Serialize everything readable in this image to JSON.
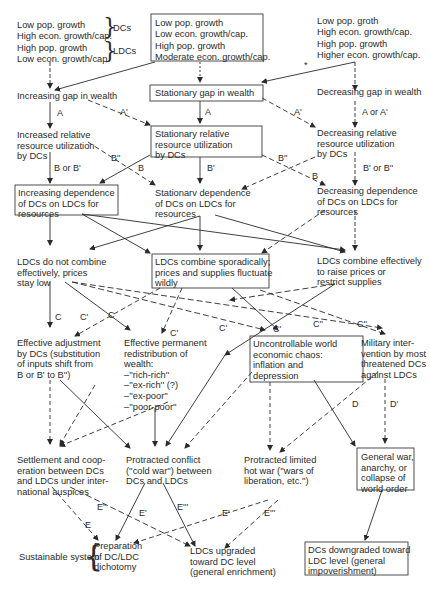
{
  "scenarios": {
    "left": {
      "dc_line1": "Low pop. growth",
      "dc_line2": "High econ. growth/cap.",
      "dc_tag": "DCs",
      "ldc_line1": "High pop. growth",
      "ldc_line2": "Low econ. growth/cap.",
      "ldc_tag": "LDCs"
    },
    "center": {
      "line1": "Low pop. growth",
      "line2": "Low econ. growth/cap.",
      "line3": "High pop. growth",
      "line4": "Moderate econ. growth/cap."
    },
    "right": {
      "line1": "Low pop. groth",
      "line2": "High econ. growth/cap.",
      "line3": "High pop. growth",
      "line4": "Higher econ. growth/cap."
    }
  },
  "nodes": {
    "gap_increasing": "Increasing gap in wealth",
    "gap_stationary": "Stationary gap in wealth",
    "gap_decreasing": "Decreasing gap in wealth",
    "util_increased": "Increased relative\nresource utilization\nby DCs",
    "util_stationary": "Stationary relative\nresource utilization\nby DCs",
    "util_decreasing": "Decreasing relative\nresource utilization\nby DCs",
    "dep_increasing": "Increasing dependence\nof DCs on LDCs for\nresources",
    "dep_stationary": "Stationarv dependence\nof DCs on LDCs for\nresources",
    "dep_decreasing": "Decreasing dependence\nof DCs on LDCs for\nresources",
    "ldc_not_combine": "LDCs do not combine\neffectively, prices\nstay low",
    "ldc_sporadic": "LDCs combine sporadically;\nprices and supplies fluctuate\nwildly",
    "ldc_effective": "LDCs combine effectively\nto raise prices or\nrestrict supplies",
    "adjustment": "Effective adjustment\nby DCs (substitution\nof inputs shift from\nB or B' to B'')",
    "redistribution": "Effective permanent\nredistribution of\nwealth:\n–''rich-rich''\n–''ex-rich'' (?)\n–''ex-poor''\n–''poor-poor''",
    "chaos": "Uncontrollable world\neconomic chaos:\ninflation and\ndepression",
    "military": "Military inter-\nvention by most\nthreatened DCs\nagainst LDCs",
    "settlement": "Settlement and coop-\neration between DCs\nand LDCs under inter-\nnational auspices",
    "cold_war": "Protracted conflict\n(''cold war'') between\nDCs and LDCs",
    "hot_war": "Protracted limited\nhot war (''wars of\nliberation, etc.'')",
    "general_war": "General war,\nanarchy, or\ncollapse of\nworld order",
    "sustainable_label": "Sustainable system",
    "dichotomy": "Preparation\nof DC/LDC\ndichotomy",
    "ldc_upgraded": "LDCs upgraded\ntoward DC level\n(general enrichment)",
    "dc_downgraded": "DCs downgraded toward\nLDC level (general\nimpoverishment)"
  },
  "edge_labels": {
    "A_left": "A",
    "A_prime_left": "A'",
    "A_center": "A",
    "A_prime_right": "A'",
    "A_or_A_prime": "A or A'",
    "B_or_B_prime": "B or B'",
    "B_dbl_left": "B''",
    "B_left": "B",
    "B_prime_center": "B'",
    "B_dbl_center": "B''",
    "B_center": "B",
    "B_prime_or_B_dbl": "B' or B''",
    "C_1": "C",
    "C_prime_1": "C'",
    "C_2": "C",
    "C_prime_2": "C'",
    "C_prime_3": "C'",
    "C_prime_4": "C'",
    "C_dbl": "C''",
    "C_dbl_2": "C''",
    "D": "D",
    "D_prime": "D'",
    "E_dbl": "E''",
    "E_prime_1": "E'",
    "E": "E",
    "E_triple_1": "E'''",
    "E_prime_2": "E'",
    "E_triple_2": "E'''",
    "asterisk": "*"
  }
}
